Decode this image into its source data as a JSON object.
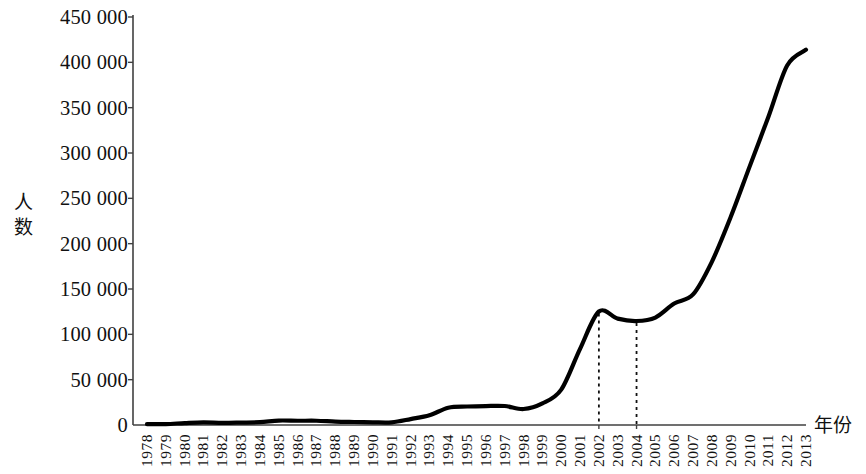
{
  "chart_data": {
    "type": "line",
    "title": "",
    "xlabel": "年份",
    "ylabel": "人数",
    "grid": false,
    "legend": "none",
    "xlim": [
      1978,
      2013
    ],
    "ylim": [
      0,
      450000
    ],
    "ytick_labels": [
      "450 000",
      "400 000",
      "350 000",
      "300 000",
      "250 000",
      "200 000",
      "150 000",
      "100 000",
      "50 000",
      "0"
    ],
    "ytick_values": [
      450000,
      400000,
      350000,
      300000,
      250000,
      200000,
      150000,
      100000,
      50000,
      0
    ],
    "categories": [
      "1978",
      "1979",
      "1980",
      "1981",
      "1982",
      "1983",
      "1984",
      "1985",
      "1986",
      "1987",
      "1988",
      "1989",
      "1990",
      "1991",
      "1992",
      "1993",
      "1994",
      "1995",
      "1996",
      "1997",
      "1998",
      "1999",
      "2000",
      "2001",
      "2002",
      "2003",
      "2004",
      "2005",
      "2006",
      "2007",
      "2008",
      "2009",
      "2010",
      "2011",
      "2012",
      "2013"
    ],
    "series": [
      {
        "name": "人数",
        "color": "#000000",
        "values": [
          860,
          1000,
          2124,
          2922,
          2326,
          2633,
          3073,
          4888,
          4676,
          4703,
          3786,
          3329,
          2950,
          2900,
          6540,
          10742,
          19071,
          20381,
          20905,
          20924,
          17622,
          23749,
          38989,
          83973,
          125179,
          117307,
          114682,
          118515,
          134000,
          144000,
          180000,
          229300,
          284700,
          339700,
          396600,
          413900
        ]
      }
    ],
    "annotations": [
      {
        "type": "dashed-vline",
        "x": "2002",
        "name": "dashed-line-2002"
      },
      {
        "type": "dashed-vline",
        "x": "2004",
        "name": "dashed-line-2004"
      }
    ],
    "axis_color": "#404040",
    "line_color": "#000000",
    "line_width": 4.2
  }
}
